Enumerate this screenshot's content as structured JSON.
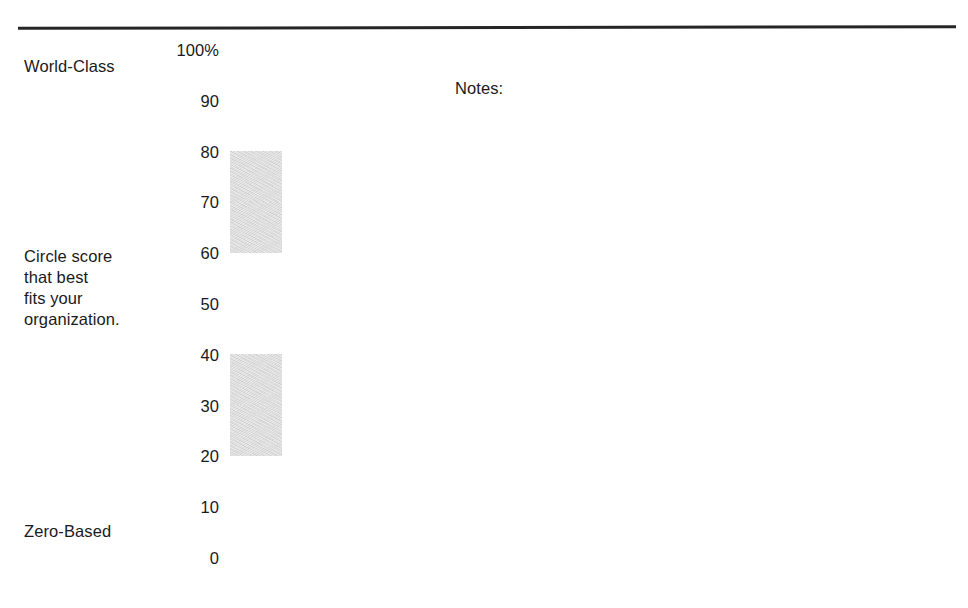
{
  "document": {
    "top_rule": "horizontal-rule",
    "bottom_rule": "horizontal-rule"
  },
  "labels": {
    "top_anchor": "World-Class",
    "instruction": "Circle score\nthat best\nfits your\norganization.",
    "bottom_anchor": "Zero-Based"
  },
  "notes": {
    "heading": "Notes:",
    "content": ""
  },
  "colors": {
    "ink": "#1a1a1a",
    "rule": "#262626",
    "cell_border": "#1c1c1c",
    "cell_fill": "#ffffff",
    "cell_shaded_fill": "#e3e3e3"
  },
  "chart_data": {
    "type": "bar",
    "title": "",
    "subtitle": "",
    "xlabel": "",
    "ylabel": "",
    "orientation": "vertical-scale",
    "grid": false,
    "legend": null,
    "ylim": [
      0,
      100
    ],
    "tick_labels": [
      "100%",
      "90",
      "80",
      "70",
      "60",
      "50",
      "40",
      "30",
      "20",
      "10",
      "0"
    ],
    "tick_values": [
      100,
      90,
      80,
      70,
      60,
      50,
      40,
      30,
      20,
      10,
      0
    ],
    "annotations": [
      {
        "text": "World-Class",
        "at_value": 100
      },
      {
        "text": "Circle score that best fits your organization.",
        "at_value": 55
      },
      {
        "text": "Zero-Based",
        "at_value": 0
      }
    ],
    "cells": [
      {
        "label": "90-100",
        "low": 90,
        "high": 100,
        "shaded": false
      },
      {
        "label": "80-90",
        "low": 80,
        "high": 90,
        "shaded": false
      },
      {
        "label": "70-80",
        "low": 70,
        "high": 80,
        "shaded": true
      },
      {
        "label": "60-70",
        "low": 60,
        "high": 70,
        "shaded": true
      },
      {
        "label": "50-60",
        "low": 50,
        "high": 60,
        "shaded": false
      },
      {
        "label": "40-50",
        "low": 40,
        "high": 50,
        "shaded": false
      },
      {
        "label": "30-40",
        "low": 30,
        "high": 40,
        "shaded": true
      },
      {
        "label": "20-30",
        "low": 20,
        "high": 30,
        "shaded": true
      },
      {
        "label": "10-20",
        "low": 10,
        "high": 20,
        "shaded": false
      },
      {
        "label": "0-10",
        "low": 0,
        "high": 10,
        "shaded": false
      }
    ],
    "shaded_ranges": [
      [
        60,
        80
      ],
      [
        20,
        40
      ]
    ]
  }
}
